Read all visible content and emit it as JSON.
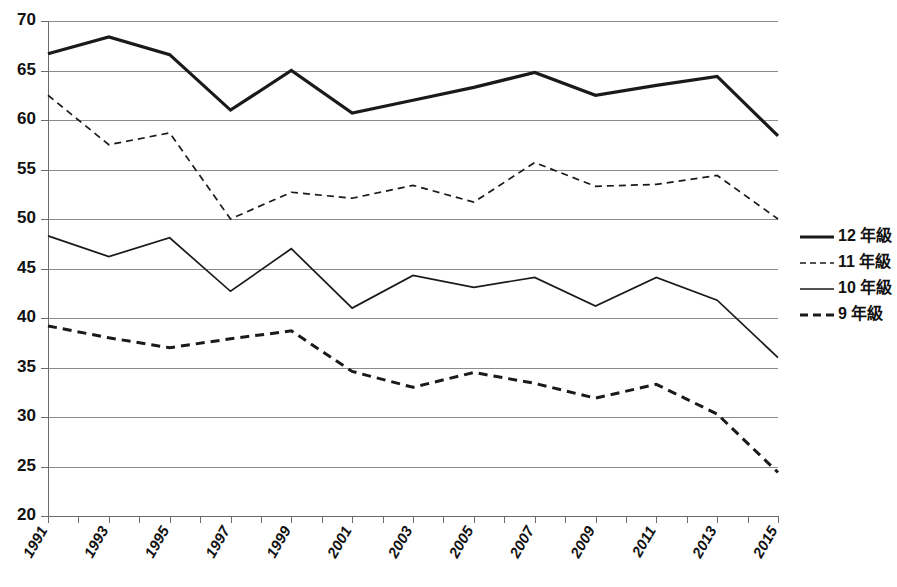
{
  "chart_data": {
    "type": "line",
    "title": "",
    "subtitle": "",
    "xlabel": "",
    "ylabel": "",
    "ylim": [
      20,
      70
    ],
    "xlim": [
      1991,
      2015
    ],
    "grid": true,
    "legend_position": "right",
    "y_ticks": [
      20,
      25,
      30,
      35,
      40,
      45,
      50,
      55,
      60,
      65,
      70
    ],
    "x_ticks": [
      1991,
      1992,
      1993,
      1994,
      1995,
      1996,
      1997,
      1998,
      1999,
      2000,
      2001,
      2002,
      2003,
      2004,
      2005,
      2006,
      2007,
      2008,
      2009,
      2010,
      2011,
      2012,
      2013,
      2014,
      2015
    ],
    "x_tick_labels": [
      "1991",
      "",
      "1993",
      "",
      "1995",
      "",
      "1997",
      "",
      "1999",
      "",
      "2001",
      "",
      "2003",
      "",
      "2005",
      "",
      "2007",
      "",
      "2009",
      "",
      "2011",
      "",
      "2013",
      "",
      "2015"
    ],
    "x": [
      1991,
      1993,
      1995,
      1997,
      1999,
      2001,
      2003,
      2005,
      2007,
      2009,
      2011,
      2013,
      2015
    ],
    "categories": [
      "1991",
      "1993",
      "1995",
      "1997",
      "1999",
      "2001",
      "2003",
      "2005",
      "2007",
      "2009",
      "2011",
      "2013",
      "2015"
    ],
    "series": [
      {
        "name": "12 年級",
        "style": "solid",
        "width": 3.2,
        "color": "#1a1a1a",
        "values": [
          66.7,
          68.4,
          66.6,
          61.0,
          65.0,
          60.7,
          62.0,
          63.3,
          64.8,
          62.5,
          63.5,
          64.4,
          58.4
        ]
      },
      {
        "name": "11 年級",
        "style": "dashed",
        "width": 1.7,
        "color": "#1a1a1a",
        "values": [
          62.5,
          57.5,
          58.7,
          50.0,
          52.7,
          52.1,
          53.4,
          51.7,
          55.7,
          53.3,
          53.5,
          54.4,
          50.0
        ]
      },
      {
        "name": "10 年級",
        "style": "solid",
        "width": 1.7,
        "color": "#4a4a4a",
        "values": [
          48.3,
          46.2,
          48.1,
          42.7,
          47.0,
          41.0,
          44.3,
          43.1,
          44.1,
          41.2,
          44.1,
          41.8,
          36.0
        ]
      },
      {
        "name": "9 年級",
        "style": "dashed",
        "width": 3.0,
        "color": "#1a1a1a",
        "values": [
          39.2,
          38.0,
          37.0,
          37.9,
          38.7,
          34.6,
          33.0,
          34.5,
          33.4,
          31.9,
          33.3,
          30.3,
          24.4
        ]
      }
    ]
  },
  "legend": {
    "items": [
      {
        "label": "12 年級"
      },
      {
        "label": "11 年級"
      },
      {
        "label": "10 年級"
      },
      {
        "label": "9 年級"
      }
    ]
  }
}
